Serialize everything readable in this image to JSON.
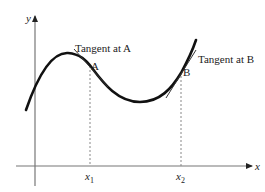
{
  "diagram": {
    "axes": {
      "x_label": "x",
      "y_label": "y",
      "ticks": [
        {
          "base": "x",
          "sub": "1"
        },
        {
          "base": "x",
          "sub": "2"
        }
      ]
    },
    "points": [
      {
        "name": "A",
        "tangent_label": "Tangent at A"
      },
      {
        "name": "B",
        "tangent_label": "Tangent at B"
      }
    ],
    "colors": {
      "axis": "#777777",
      "curve": "#111111",
      "tangent": "#333333",
      "dashed": "#888888",
      "text": "#222222"
    }
  }
}
